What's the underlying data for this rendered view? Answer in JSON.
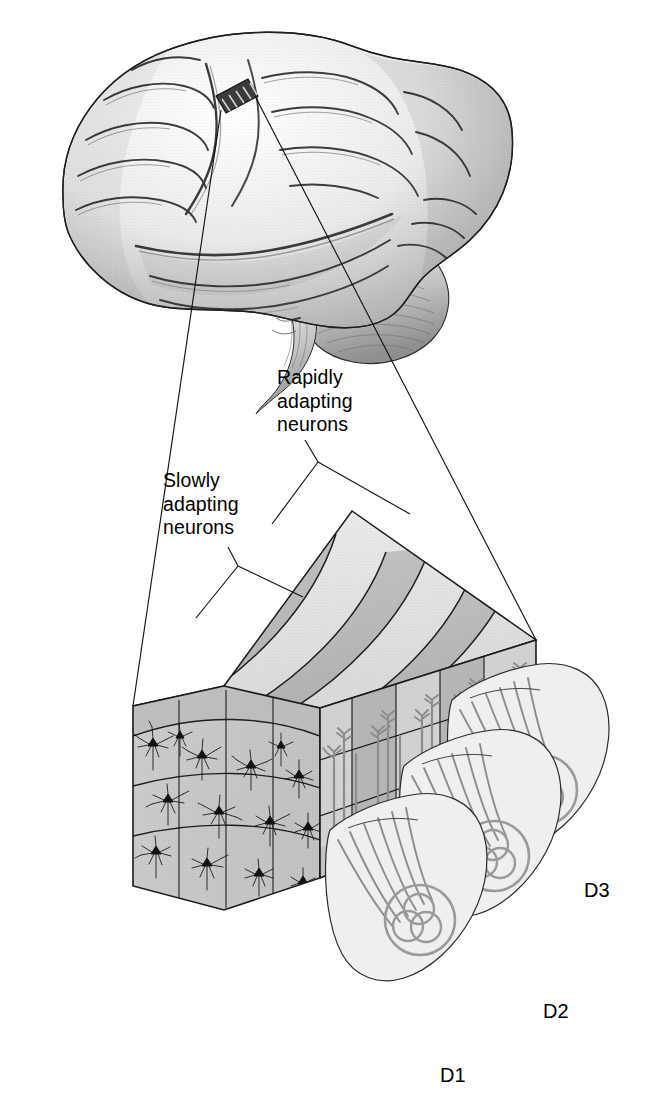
{
  "figure": {
    "kind": "anatomical-diagram",
    "background_color": "#ffffff",
    "width": 664,
    "height": 1120
  },
  "labels": {
    "slowly_adapting": "Slowly\nadapting\nneurons",
    "rapidly_adapting": "Rapidly\nadapting\nneurons"
  },
  "digits": [
    {
      "id": "d1",
      "label": "D1"
    },
    {
      "id": "d2",
      "label": "D2"
    },
    {
      "id": "d3",
      "label": "D3"
    }
  ],
  "brain": {
    "name": "lateral-view-human-brain",
    "marker_name": "cortical-recording-strip",
    "marker_stripe_count": 5,
    "parts": [
      "cerebrum",
      "cerebellum",
      "brainstem"
    ]
  },
  "cortical_block": {
    "name": "cortical-column-block",
    "top_band_count": 5,
    "column_count": 5,
    "layer_count": 3,
    "neuron_count": 14,
    "afferent_fiber_count": 12,
    "faces": [
      "top",
      "front",
      "right"
    ]
  },
  "colors": {
    "band_light": "#e3e3e3",
    "band_dark": "#bcbcbc",
    "face_front": "#c9c9c9",
    "face_right_light": "#d6d6d6",
    "face_right_dark": "#b4b4b4",
    "outline": "#1a1a1a",
    "fiber": "#8e8e8e",
    "skin": "#f0f0f0",
    "receptive_field": "#9a9a9a",
    "neuron": "#111111",
    "brain_light": "#f2f2f2",
    "brain_mid": "#c8c8c8",
    "brain_dark": "#8a8a8a",
    "text": "#000000"
  },
  "leader_lines": {
    "magnifier_left": "brain-strip-to-block-front-left",
    "magnifier_right": "brain-strip-to-block-top-right",
    "slow_pointer": "slowly-adapting-label-to-light-band",
    "rapid_pointer": "rapidly-adapting-label-to-dark-band"
  }
}
